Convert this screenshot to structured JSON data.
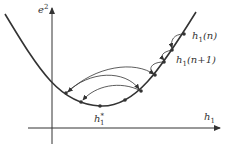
{
  "diagram": {
    "type": "error-surface-gradient-descent",
    "y_axis_label": "e",
    "y_axis_sup": "2",
    "x_axis_label": "h",
    "x_axis_sub": "1",
    "labels": {
      "hn_base": "h",
      "hn_sub": "1",
      "hn_arg": "(n)",
      "hn1_base": "h",
      "hn1_sub": "1",
      "hn1_arg": "(n+1)",
      "opt_base": "h",
      "opt_sub": "1",
      "opt_sup": "*"
    },
    "colors": {
      "line": "#333333",
      "background": "#ffffff"
    }
  }
}
